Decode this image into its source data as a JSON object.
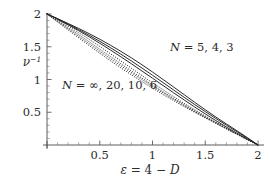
{
  "chart_data": {
    "type": "line",
    "title": "",
    "xlabel": "ε = 4 − D",
    "ylabel": "ν⁻¹",
    "xlim": [
      0,
      2.08
    ],
    "ylim": [
      0,
      2.12
    ],
    "grid": false,
    "legend_position": "inline-annotations",
    "xticks": [
      0.5,
      1,
      1.5,
      2
    ],
    "xtick_labels": [
      "0.5",
      "1",
      "1.5",
      "2"
    ],
    "yticks": [
      0.5,
      1,
      1.5,
      2
    ],
    "ytick_labels": [
      "0.5",
      "1",
      "1.5",
      "2"
    ],
    "annotations": [
      {
        "id": "upper-group",
        "text": "N = 5, 4, 3",
        "n_values": [
          "5",
          "4",
          "3"
        ],
        "x": 1.3,
        "y": 1.46,
        "style": "solid"
      },
      {
        "id": "lower-group",
        "text": "N = ∞, 20, 10, 6",
        "n_values": [
          "∞",
          "20",
          "10",
          "6"
        ],
        "x": 0.37,
        "y": 0.92,
        "style": "dotted"
      }
    ],
    "series": [
      {
        "name": "N = 5",
        "style": "solid",
        "x": [
          0,
          0.1,
          0.2,
          0.3,
          0.4,
          0.5,
          0.6,
          0.7,
          0.8,
          0.9,
          1.0,
          1.1,
          1.2,
          1.3,
          1.4,
          1.5,
          1.6,
          1.7,
          1.8,
          1.9,
          2.0
        ],
        "values": [
          2.0,
          1.93,
          1.855,
          1.78,
          1.7,
          1.615,
          1.525,
          1.43,
          1.33,
          1.225,
          1.115,
          1.0,
          0.885,
          0.768,
          0.652,
          0.538,
          0.428,
          0.322,
          0.218,
          0.112,
          0.0
        ]
      },
      {
        "name": "N = 4",
        "style": "solid",
        "x": [
          0,
          0.1,
          0.2,
          0.3,
          0.4,
          0.5,
          0.6,
          0.7,
          0.8,
          0.9,
          1.0,
          1.1,
          1.2,
          1.3,
          1.4,
          1.5,
          1.6,
          1.7,
          1.8,
          1.9,
          2.0
        ],
        "values": [
          2.0,
          1.925,
          1.845,
          1.762,
          1.675,
          1.583,
          1.487,
          1.387,
          1.283,
          1.175,
          1.065,
          0.953,
          0.84,
          0.728,
          0.618,
          0.51,
          0.405,
          0.303,
          0.203,
          0.103,
          0.0
        ]
      },
      {
        "name": "N = 3",
        "style": "solid",
        "x": [
          0,
          0.1,
          0.2,
          0.3,
          0.4,
          0.5,
          0.6,
          0.7,
          0.8,
          0.9,
          1.0,
          1.1,
          1.2,
          1.3,
          1.4,
          1.5,
          1.6,
          1.7,
          1.8,
          1.9,
          2.0
        ],
        "values": [
          2.0,
          1.92,
          1.835,
          1.745,
          1.652,
          1.553,
          1.452,
          1.347,
          1.24,
          1.13,
          1.02,
          0.908,
          0.797,
          0.688,
          0.58,
          0.475,
          0.373,
          0.275,
          0.18,
          0.089,
          0.0
        ]
      },
      {
        "name": "N = 6",
        "style": "dotted",
        "x": [
          0,
          0.1,
          0.2,
          0.3,
          0.4,
          0.5,
          0.6,
          0.7,
          0.8,
          0.9,
          1.0,
          1.1,
          1.2,
          1.3,
          1.4,
          1.5,
          1.6,
          1.7,
          1.8,
          1.9,
          2.0
        ],
        "values": [
          2.0,
          1.91,
          1.815,
          1.715,
          1.612,
          1.505,
          1.395,
          1.283,
          1.172,
          1.06,
          0.95,
          0.843,
          0.738,
          0.636,
          0.538,
          0.443,
          0.35,
          0.259,
          0.171,
          0.085,
          0.0
        ]
      },
      {
        "name": "N = 10",
        "style": "dotted",
        "x": [
          0,
          0.1,
          0.2,
          0.3,
          0.4,
          0.5,
          0.6,
          0.7,
          0.8,
          0.9,
          1.0,
          1.1,
          1.2,
          1.3,
          1.4,
          1.5,
          1.6,
          1.7,
          1.8,
          1.9,
          2.0
        ],
        "values": [
          2.0,
          1.898,
          1.793,
          1.685,
          1.575,
          1.463,
          1.352,
          1.24,
          1.13,
          1.022,
          0.915,
          0.812,
          0.712,
          0.615,
          0.521,
          0.43,
          0.341,
          0.253,
          0.167,
          0.083,
          0.0
        ]
      },
      {
        "name": "N = 20",
        "style": "dotted",
        "x": [
          0,
          0.1,
          0.2,
          0.3,
          0.4,
          0.5,
          0.6,
          0.7,
          0.8,
          0.9,
          1.0,
          1.1,
          1.2,
          1.3,
          1.4,
          1.5,
          1.6,
          1.7,
          1.8,
          1.9,
          2.0
        ],
        "values": [
          2.0,
          1.888,
          1.775,
          1.66,
          1.546,
          1.432,
          1.32,
          1.21,
          1.103,
          0.998,
          0.895,
          0.795,
          0.698,
          0.603,
          0.511,
          0.422,
          0.335,
          0.249,
          0.165,
          0.082,
          0.0
        ]
      },
      {
        "name": "N = ∞",
        "style": "dotted",
        "x": [
          0,
          0.1,
          0.2,
          0.3,
          0.4,
          0.5,
          0.6,
          0.7,
          0.8,
          0.9,
          1.0,
          1.1,
          1.2,
          1.3,
          1.4,
          1.5,
          1.6,
          1.7,
          1.8,
          1.9,
          2.0
        ],
        "values": [
          2.0,
          1.878,
          1.757,
          1.637,
          1.518,
          1.402,
          1.288,
          1.178,
          1.072,
          0.968,
          0.868,
          0.771,
          0.677,
          0.586,
          0.498,
          0.413,
          0.329,
          0.246,
          0.163,
          0.081,
          0.0
        ]
      }
    ]
  }
}
